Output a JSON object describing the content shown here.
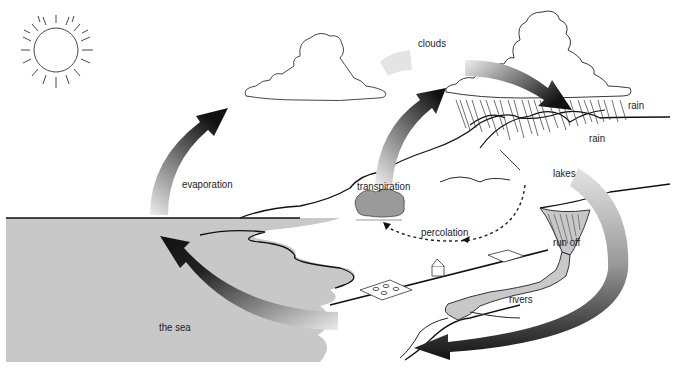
{
  "diagram": {
    "colors": {
      "sea": "#c8c8c8",
      "land": "#ffffff",
      "outline": "#111111",
      "arrow_dark": "#111111",
      "arrow_light": "#e6e6e6",
      "tree": "#9a9a9a"
    },
    "labels": {
      "clouds": "clouds",
      "rain_top": "rain",
      "rain_lower": "rain",
      "evaporation": "evaporation",
      "transpiration": "transpiration",
      "lakes": "lakes",
      "percolation": "percolation",
      "run_off": "run off",
      "rivers": "rivers",
      "the_sea": "the sea"
    },
    "elements": [
      "sun",
      "cloud-left",
      "cloud-right-raincloud",
      "rain",
      "mountains",
      "trees",
      "house",
      "fields",
      "lake",
      "river",
      "sea"
    ],
    "arrows": [
      "evaporation-arrow",
      "cloud-to-cloud-arrow",
      "transpiration-arrow",
      "runoff-arrow",
      "river-to-sea-arrow",
      "percolation-arrow"
    ]
  }
}
